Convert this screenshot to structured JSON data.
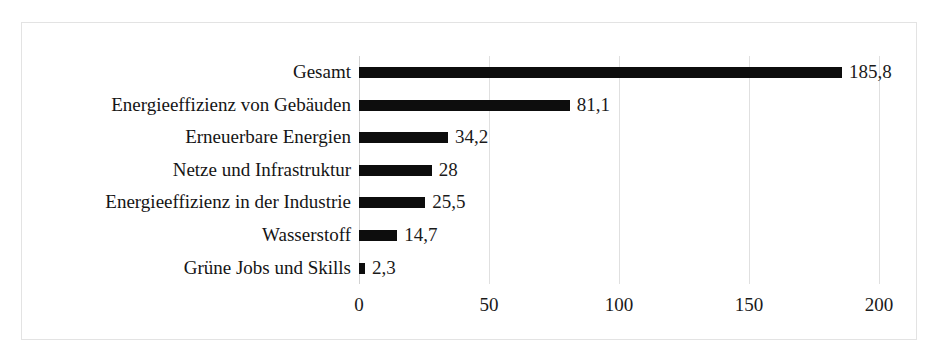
{
  "chart_data": {
    "type": "bar",
    "orientation": "horizontal",
    "title": "",
    "subtitle": "",
    "xlabel": "",
    "ylabel": "",
    "categories": [
      "Gesamt",
      "Energieeffizienz von Gebäuden",
      "Erneuerbare Energien",
      "Netze und Infrastruktur",
      "Energieeffizienz in der Industrie",
      "Wasserstoff",
      "Grüne Jobs und Skills"
    ],
    "values": [
      185.8,
      81.1,
      34.2,
      28,
      25.5,
      14.7,
      2.3
    ],
    "value_labels": [
      "185,8",
      "81,1",
      "34,2",
      "28",
      "25,5",
      "14,7",
      "2,3"
    ],
    "xlim": [
      0,
      200
    ],
    "xticks": [
      0,
      50,
      100,
      150,
      200
    ],
    "xtick_labels": [
      "0",
      "50",
      "100",
      "150",
      "200"
    ],
    "grid": true,
    "grid_axis": "x",
    "legend": false,
    "bar_color": "#0d0d0d",
    "gridline_color": "#e0e0e0",
    "frame_color": "#e3e3e3",
    "background_color": "#ffffff",
    "decimal_separator": ","
  }
}
